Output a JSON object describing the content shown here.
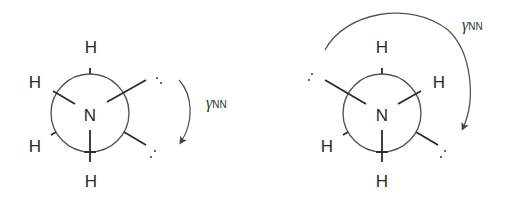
{
  "figure": {
    "left": {
      "center_atom": "N",
      "atoms": [
        "H",
        "H",
        "H",
        "H"
      ],
      "lone_pair_symbol": ":",
      "torsion_label": {
        "symbol": "γ",
        "subscript": "NN"
      }
    },
    "right": {
      "center_atom": "N",
      "atoms": [
        "H",
        "H",
        "H",
        "H"
      ],
      "lone_pair_symbol": ":",
      "torsion_label": {
        "symbol": "γ",
        "subscript": "NN"
      }
    }
  }
}
